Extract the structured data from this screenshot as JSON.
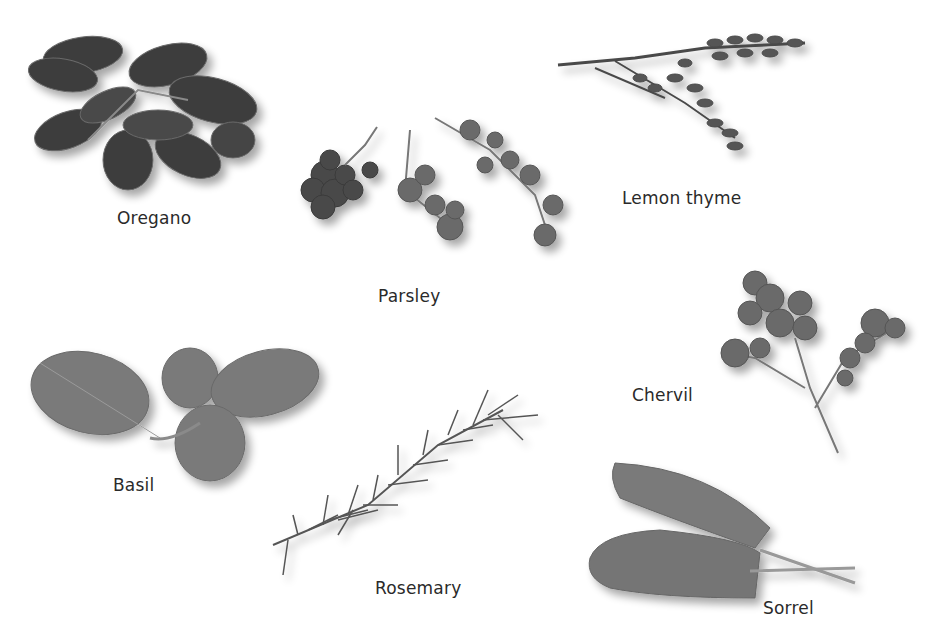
{
  "figure": {
    "background": "#ffffff",
    "herbs": [
      {
        "name": "Oregano",
        "label_pos": [
          117,
          208
        ]
      },
      {
        "name": "Parsley",
        "label_pos": [
          378,
          286
        ]
      },
      {
        "name": "Lemon thyme",
        "label_pos": [
          622,
          188
        ]
      },
      {
        "name": "Chervil",
        "label_pos": [
          632,
          385
        ]
      },
      {
        "name": "Basil",
        "label_pos": [
          113,
          475
        ]
      },
      {
        "name": "Rosemary",
        "label_pos": [
          375,
          578
        ]
      },
      {
        "name": "Sorrel",
        "label_pos": [
          763,
          598
        ]
      }
    ]
  }
}
